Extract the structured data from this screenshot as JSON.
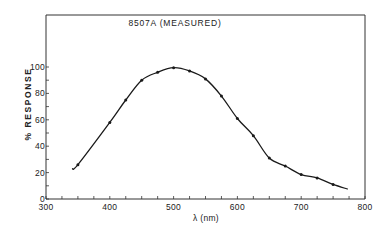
{
  "chart_data": {
    "type": "line",
    "title": "8507A (MEASURED)",
    "xlabel": "λ (nm)",
    "ylabel": "% RESPONSE",
    "xlim": [
      300,
      800
    ],
    "ylim": [
      0,
      100
    ],
    "x_ticks": [
      300,
      400,
      500,
      600,
      700,
      800
    ],
    "x_minor_step": 25,
    "y_ticks": [
      0,
      20,
      40,
      60,
      80,
      100
    ],
    "y_minor_step": 10,
    "grid": false,
    "legend": null,
    "series": [
      {
        "name": "8507A measured",
        "markers": true,
        "x": [
          350,
          400,
          425,
          450,
          475,
          500,
          525,
          550,
          575,
          600,
          625,
          650,
          675,
          700,
          725,
          750
        ],
        "values": [
          26,
          58,
          75,
          90,
          96,
          99.5,
          97,
          91,
          78,
          61,
          48,
          31,
          25,
          18.5,
          16,
          11
        ]
      }
    ],
    "curve_extent": {
      "start": {
        "x": 341,
        "y": 23
      },
      "end": {
        "x": 773,
        "y": 7.5
      }
    }
  },
  "labels": {
    "title": "8507A (MEASURED)",
    "xlabel": "λ (nm)",
    "ylabel": "% RESPONSE",
    "x_tick_labels": [
      "300",
      "400",
      "500",
      "600",
      "700",
      "800"
    ],
    "y_tick_labels": [
      "0",
      "20",
      "40",
      "60",
      "80",
      "100"
    ]
  },
  "colors": {
    "line": "#1a1a1a",
    "axis": "#333333",
    "background": "#ffffff"
  }
}
